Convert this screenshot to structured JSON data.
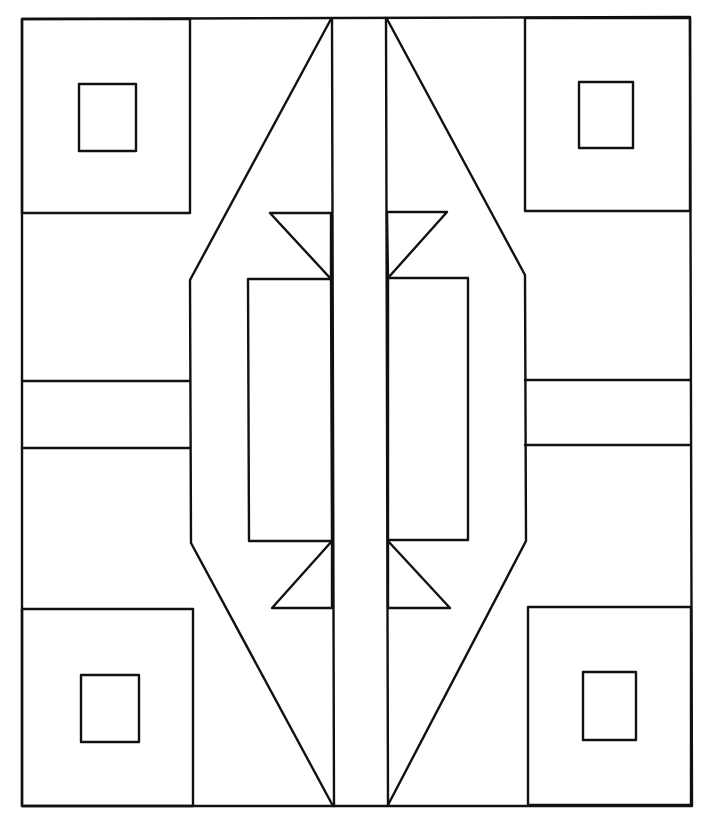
{
  "canvas": {
    "width": 709,
    "height": 817,
    "background": "#ffffff",
    "stroke": "#111111"
  },
  "drawing": {
    "outer_frame": [
      [
        22,
        19
      ],
      [
        690,
        17
      ],
      [
        692,
        806
      ],
      [
        22,
        806
      ]
    ],
    "center_strip": {
      "left": [
        [
          332,
          19
        ],
        [
          334,
          806
        ]
      ],
      "right": [
        [
          386,
          18
        ],
        [
          388,
          805
        ]
      ]
    },
    "corner_blocks": [
      {
        "name": "top-left",
        "outer": [
          [
            22,
            19
          ],
          [
            190,
            19
          ],
          [
            190,
            213
          ],
          [
            22,
            213
          ]
        ],
        "inner": [
          [
            79,
            84
          ],
          [
            136,
            84
          ],
          [
            136,
            151
          ],
          [
            79,
            151
          ]
        ]
      },
      {
        "name": "top-right",
        "outer": [
          [
            525,
            18
          ],
          [
            690,
            18
          ],
          [
            690,
            211
          ],
          [
            525,
            211
          ]
        ],
        "inner": [
          [
            579,
            82
          ],
          [
            633,
            82
          ],
          [
            633,
            148
          ],
          [
            579,
            148
          ]
        ]
      },
      {
        "name": "bottom-left",
        "outer": [
          [
            22,
            609
          ],
          [
            193,
            609
          ],
          [
            193,
            806
          ],
          [
            22,
            806
          ]
        ],
        "inner": [
          [
            81,
            675
          ],
          [
            139,
            675
          ],
          [
            139,
            742
          ],
          [
            81,
            742
          ]
        ]
      },
      {
        "name": "bottom-right",
        "outer": [
          [
            528,
            607
          ],
          [
            691,
            607
          ],
          [
            691,
            805
          ],
          [
            528,
            805
          ]
        ],
        "inner": [
          [
            583,
            672
          ],
          [
            636,
            672
          ],
          [
            636,
            740
          ],
          [
            583,
            740
          ]
        ]
      }
    ],
    "side_bands": [
      {
        "name": "left-band-top",
        "points": [
          [
            22,
            381
          ],
          [
            190,
            381
          ]
        ]
      },
      {
        "name": "left-band-bottom",
        "points": [
          [
            22,
            448
          ],
          [
            190,
            448
          ]
        ]
      },
      {
        "name": "right-band-top",
        "points": [
          [
            525,
            380
          ],
          [
            690,
            380
          ]
        ]
      },
      {
        "name": "right-band-bottom",
        "points": [
          [
            525,
            445
          ],
          [
            690,
            445
          ]
        ]
      }
    ],
    "hexagon_halves": [
      {
        "name": "left-half",
        "points": [
          [
            331,
            19
          ],
          [
            190,
            280
          ],
          [
            191,
            543
          ],
          [
            333,
            806
          ]
        ]
      },
      {
        "name": "right-half",
        "points": [
          [
            387,
            19
          ],
          [
            525,
            275
          ],
          [
            526,
            541
          ],
          [
            388,
            805
          ]
        ]
      }
    ],
    "inner_rects": [
      {
        "name": "left-inner-rect",
        "points": [
          [
            248,
            279
          ],
          [
            331,
            279
          ],
          [
            332,
            541
          ],
          [
            249,
            541
          ]
        ]
      },
      {
        "name": "right-inner-rect",
        "points": [
          [
            388,
            278
          ],
          [
            468,
            278
          ],
          [
            468,
            540
          ],
          [
            388,
            540
          ]
        ]
      }
    ],
    "triangles": [
      {
        "name": "top-left-triangle",
        "points": [
          [
            270,
            213
          ],
          [
            331,
            213
          ],
          [
            331,
            279
          ]
        ]
      },
      {
        "name": "top-right-triangle",
        "points": [
          [
            387,
            212
          ],
          [
            447,
            212
          ],
          [
            388,
            278
          ]
        ]
      },
      {
        "name": "bottom-left-triangle",
        "points": [
          [
            332,
            541
          ],
          [
            272,
            608
          ],
          [
            332,
            608
          ]
        ]
      },
      {
        "name": "bottom-right-triangle",
        "points": [
          [
            388,
            541
          ],
          [
            450,
            608
          ],
          [
            388,
            608
          ]
        ]
      }
    ]
  }
}
